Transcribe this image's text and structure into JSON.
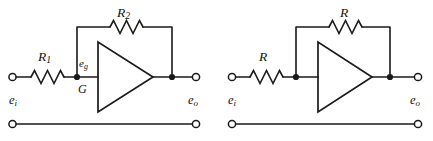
{
  "figure": {
    "type": "schematic",
    "background_color": "#ffffff",
    "line_color": "#1a1a1a"
  },
  "circuits": [
    {
      "id": "left-circuit",
      "name": "inverting-amplifier-general",
      "input_label": "e",
      "input_sub": "i",
      "output_label": "e",
      "output_sub": "o",
      "input_resistor": {
        "label": "R",
        "sub": "2"
      },
      "series_resistor": {
        "label": "R",
        "sub": "1"
      },
      "feedback_resistor": {
        "label": "R",
        "sub": "2"
      },
      "node_label": "e",
      "node_sub": "g",
      "ground_node_label": "G",
      "amplifier": {
        "shape": "triangle",
        "orientation": "right"
      }
    },
    {
      "id": "right-circuit",
      "name": "inverting-amplifier-unity-gain",
      "input_label": "e",
      "input_sub": "i",
      "output_label": "e",
      "output_sub": "o",
      "series_resistor": {
        "label": "R",
        "sub": ""
      },
      "feedback_resistor": {
        "label": "R",
        "sub": ""
      },
      "amplifier": {
        "shape": "triangle",
        "orientation": "right"
      }
    }
  ]
}
